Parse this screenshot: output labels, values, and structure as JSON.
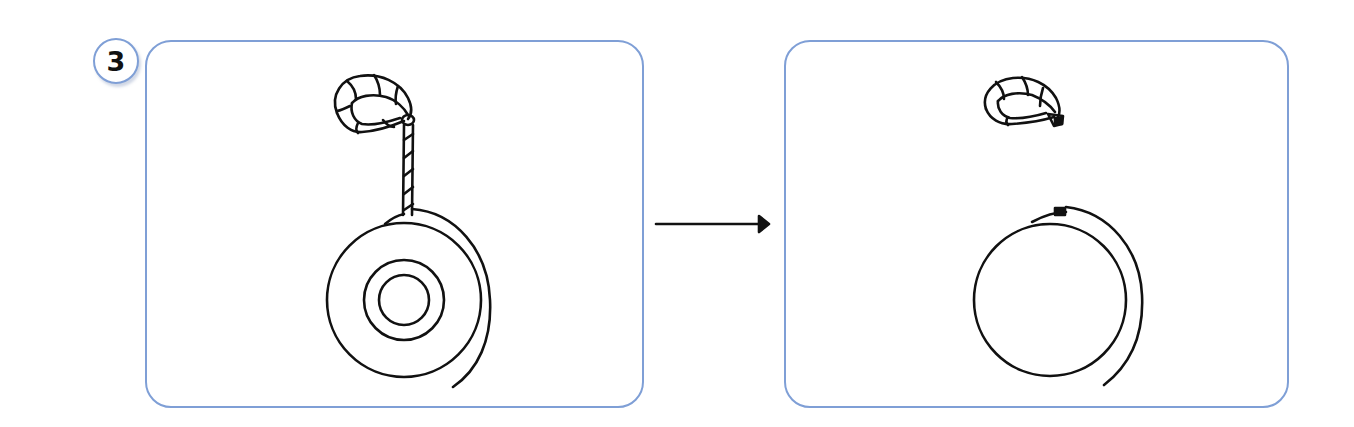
{
  "step": {
    "number": "3",
    "badge_color": "#7f9fd6"
  },
  "panels": [
    {
      "id": "before",
      "description": "Roll of tape with twisted string loop attached, string hanging from top of roll",
      "objects": [
        "string-loop",
        "string",
        "tape-roll-with-core"
      ]
    },
    {
      "id": "after",
      "description": "String detached and coiled above; tape roll without visible core",
      "objects": [
        "string-coil",
        "tape-roll"
      ]
    }
  ],
  "arrow": {
    "direction": "right",
    "meaning": "transition"
  },
  "colors": {
    "panel_border": "#7f9fd6",
    "line_art": "#111111",
    "background": "#ffffff"
  }
}
